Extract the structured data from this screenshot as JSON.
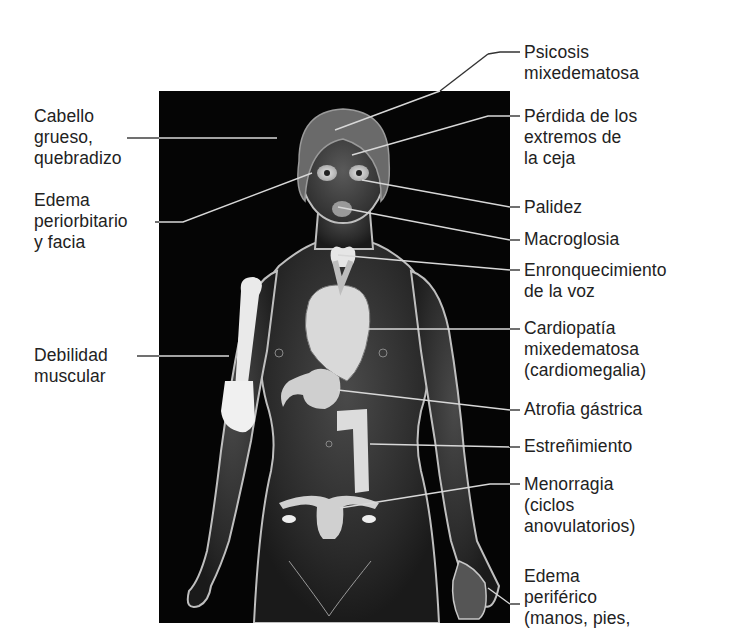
{
  "figure": {
    "panel_background": "#050505",
    "line_color_inside": "#d8d8d8",
    "line_color_outside": "#333333"
  },
  "labels_left": [
    {
      "id": "cabello",
      "text": "Cabello\ngrueso,\nquebradizo"
    },
    {
      "id": "edema-periorbitario",
      "text": "Edema\nperiorbitario\ny facia"
    },
    {
      "id": "debilidad",
      "text": "Debilidad\nmuscular"
    }
  ],
  "labels_right": [
    {
      "id": "psicosis",
      "text": "Psicosis\nmixedematosa"
    },
    {
      "id": "perdida-ceja",
      "text": "Pérdida de los\nextremos de\nla ceja"
    },
    {
      "id": "palidez",
      "text": "Palidez"
    },
    {
      "id": "macroglosia",
      "text": "Macroglosia"
    },
    {
      "id": "enronquecimiento",
      "text": "Enronquecimiento\nde la voz"
    },
    {
      "id": "cardiopatia",
      "text": "Cardiopatía\nmixedematosa\n(cardiomegalia)"
    },
    {
      "id": "atrofia",
      "text": "Atrofia gástrica"
    },
    {
      "id": "estrenimiento",
      "text": "Estreñimiento"
    },
    {
      "id": "menorragia",
      "text": "Menorragia\n(ciclos\nanovulatorios)"
    },
    {
      "id": "edema-periferico",
      "text": "Edema\nperiférico\n(manos, pies,"
    }
  ]
}
